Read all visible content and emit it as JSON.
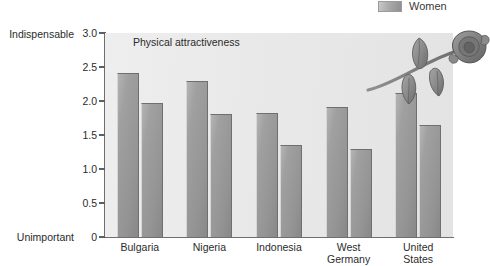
{
  "legend": {
    "items": [
      {
        "label": "Women",
        "swatch_color": "#a0a0a0",
        "icon": "legend-swatch-icon"
      }
    ]
  },
  "axis_captions": {
    "top": "Indispensable",
    "bottom": "Unimportant"
  },
  "decoration": {
    "name": "rose-illustration",
    "description": "rose flower with stem and leaves"
  },
  "chart_data": {
    "type": "bar",
    "title": "Physical attractiveness",
    "xlabel": "",
    "ylabel": "",
    "ylim": [
      0,
      3.0
    ],
    "yticks": [
      "0",
      "0.5",
      "1.0",
      "1.5",
      "2.0",
      "2.5",
      "3.0"
    ],
    "ytick_values": [
      0,
      0.5,
      1.0,
      1.5,
      2.0,
      2.5,
      3.0
    ],
    "y_axis_low_label": "Unimportant",
    "y_axis_high_label": "Indispensable",
    "grid": false,
    "legend_position": "top-right",
    "categories": [
      "Bulgaria",
      "Nigeria",
      "Indonesia",
      "West Germany",
      "United States"
    ],
    "category_lines": [
      [
        "Bulgaria"
      ],
      [
        "Nigeria"
      ],
      [
        "Indonesia"
      ],
      [
        "West",
        "Germany"
      ],
      [
        "United",
        "States"
      ]
    ],
    "series": [
      {
        "name": "Men",
        "values": [
          2.41,
          2.29,
          1.83,
          1.91,
          2.12
        ],
        "color": "#9a9a9a"
      },
      {
        "name": "Women",
        "values": [
          1.97,
          1.81,
          1.35,
          1.29,
          1.65
        ],
        "color": "#9a9a9a"
      }
    ]
  }
}
